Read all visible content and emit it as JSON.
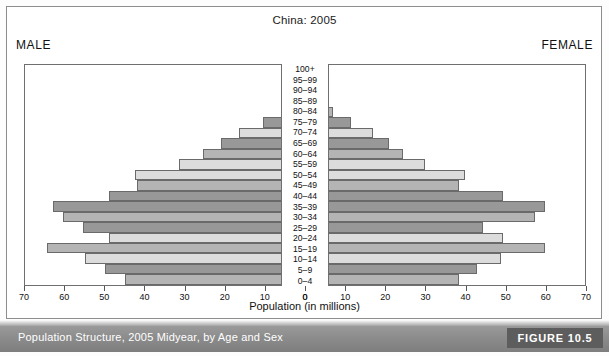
{
  "figure": {
    "title": "China: 2005",
    "male_label": "MALE",
    "female_label": "FEMALE",
    "axis_caption": "Population (in millions)",
    "caption": "Population Structure, 2005 Midyear, by Age and Sex",
    "figure_number": "FIGURE 10.5"
  },
  "palette": {
    "bar_light": "#dcdcdc",
    "bar_medium": "#b4b4b4",
    "bar_dark": "#989898",
    "bar_outline": "#6a6a6a",
    "caption_bar": "#8c8c8c",
    "badge": "#5d5d5d",
    "frame": "#8d8d8d"
  },
  "chart_data": {
    "type": "bar",
    "subtype": "population-pyramid",
    "title": "China: 2005",
    "xlabel": "Population (in millions)",
    "ylabel": "",
    "xlim": [
      0,
      70
    ],
    "xticks": [
      0,
      10,
      20,
      30,
      40,
      50,
      60,
      70
    ],
    "left_tick_labels": [
      "70",
      "60",
      "50",
      "40",
      "30",
      "20",
      "10",
      "0"
    ],
    "right_tick_labels": [
      "0",
      "10",
      "20",
      "30",
      "40",
      "50",
      "60",
      "70"
    ],
    "grid": false,
    "legend": "none",
    "categories": [
      "100+",
      "95–99",
      "90–94",
      "85–89",
      "80–84",
      "75–79",
      "70–74",
      "65–69",
      "60–64",
      "55–59",
      "50–54",
      "45–49",
      "40–44",
      "35–39",
      "30–34",
      "25–29",
      "20–24",
      "15–19",
      "10–14",
      "5–9",
      "0–4"
    ],
    "series": [
      {
        "name": "MALE",
        "side": "left",
        "values": [
          0.1,
          0.4,
          1.2,
          3.0,
          6.0,
          10.5,
          16.5,
          21.0,
          25.5,
          31.5,
          42.5,
          42.0,
          49.0,
          63.0,
          60.5,
          55.5,
          49.0,
          64.5,
          55.0,
          50.0,
          45.0
        ]
      },
      {
        "name": "FEMALE",
        "side": "right",
        "values": [
          0.2,
          0.7,
          1.8,
          3.8,
          7.0,
          11.5,
          17.0,
          21.0,
          24.5,
          30.0,
          40.0,
          38.5,
          49.5,
          60.0,
          57.5,
          44.5,
          49.5,
          60.0,
          49.0,
          43.0,
          38.5
        ]
      }
    ],
    "shades": [
      "light",
      "medium",
      "dark",
      "light",
      "medium",
      "dark",
      "light",
      "dark",
      "medium",
      "light",
      "light",
      "medium",
      "dark",
      "dark",
      "medium",
      "dark",
      "light",
      "medium",
      "light",
      "dark",
      "medium"
    ]
  }
}
